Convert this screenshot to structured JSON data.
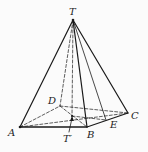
{
  "figure": {
    "type": "pyramid",
    "colors": {
      "stroke": "#1a1a1a",
      "background": "#fbfbfb"
    },
    "labels": {
      "T": "T",
      "A": "A",
      "B": "B",
      "C": "C",
      "D": "D",
      "E": "E",
      "Tp": "T′"
    },
    "points": {
      "T": [
        73,
        20
      ],
      "A": [
        20,
        127
      ],
      "B": [
        87,
        127
      ],
      "C": [
        128,
        113
      ],
      "D": [
        60,
        106
      ],
      "E": [
        106,
        120
      ],
      "Tp": [
        72,
        116
      ]
    },
    "solid_edges": [
      "TA",
      "TB",
      "TC",
      "TE",
      "AB",
      "BC"
    ],
    "dashed_edges": [
      "TD",
      "TTp",
      "AD",
      "DC",
      "AC",
      "DB",
      "TpE",
      "AE"
    ]
  }
}
